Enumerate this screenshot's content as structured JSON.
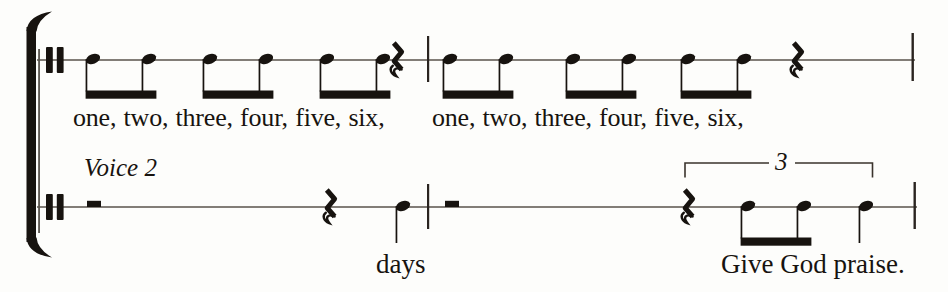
{
  "meta": {
    "background": "#fdfdfb",
    "ink": "#17130f",
    "staff_line_color": "#59524b"
  },
  "labels": {
    "voice2": "Voice 2",
    "tuplet_number": "3"
  },
  "lyrics": {
    "voice1_measure1": "one, two, three, four, five, six,",
    "voice1_measure2": "one, two, three, four, five, six,",
    "voice2_measure1": "days",
    "voice2_measure2": "Give God praise."
  },
  "notation": {
    "type": "sheet-music",
    "staves": [
      {
        "id": "voice1",
        "measures": [
          "three beamed eighth-note pairs, quarter rest",
          "three beamed eighth-note pairs, quarter rest"
        ]
      },
      {
        "id": "voice2",
        "label": "Voice 2",
        "measures": [
          "half rest, quarter rest, quarter note (days)",
          "half rest, triplet: quarter rest + two beamed eighths + quarter note (Give God praise.)"
        ]
      }
    ],
    "stamps": [
      {
        "type": "clef",
        "x": 46,
        "y": 60
      },
      {
        "type": "eighth-pair",
        "x": 93,
        "y": 60
      },
      {
        "type": "eighth-pair",
        "x": 210,
        "y": 60
      },
      {
        "type": "eighth-pair",
        "x": 327,
        "y": 60
      },
      {
        "type": "quarter-rest",
        "x": 397,
        "y": 60
      },
      {
        "type": "eighth-pair",
        "x": 450,
        "y": 60
      },
      {
        "type": "eighth-pair",
        "x": 573,
        "y": 60
      },
      {
        "type": "eighth-pair",
        "x": 688,
        "y": 60
      },
      {
        "type": "quarter-rest",
        "x": 797,
        "y": 60
      },
      {
        "type": "clef",
        "x": 46,
        "y": 207
      },
      {
        "type": "half-rest",
        "x": 94,
        "y": 207
      },
      {
        "type": "quarter-rest",
        "x": 330,
        "y": 207
      },
      {
        "type": "quarter-note",
        "x": 403,
        "y": 207
      },
      {
        "type": "half-rest",
        "x": 452,
        "y": 207
      },
      {
        "type": "quarter-rest",
        "x": 688,
        "y": 207
      },
      {
        "type": "eighth-pair",
        "x": 748,
        "y": 207
      },
      {
        "type": "quarter-note",
        "x": 866,
        "y": 207
      }
    ]
  }
}
